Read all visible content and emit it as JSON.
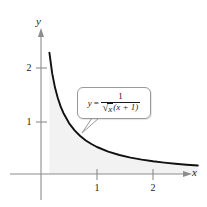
{
  "figure": {
    "name": "area-under-curve-figure",
    "background_color": "#ffffff"
  },
  "axes": {
    "x_label": "x",
    "y_label": "y",
    "x_ticks": [
      "1",
      "2"
    ],
    "y_ticks": [
      "1",
      "2"
    ],
    "axis_color": "#8c8c8c",
    "tick_color": "#8c8c8c"
  },
  "callout": {
    "name": "equation-callout",
    "lhs": "y",
    "equals": "=",
    "numerator": "1",
    "radical_sign": "√",
    "radicand": "x",
    "denominator_rest": "(x + 1)",
    "border_color": "#9a9a9a",
    "fill_color": "#ffffff"
  },
  "curve": {
    "name": "function-curve",
    "color": "#111111",
    "fill_color": "#f2f2f2"
  },
  "chart_data": {
    "type": "line",
    "title": "",
    "xlabel": "x",
    "ylabel": "y",
    "equation": "y = 1 / ( sqrt(x) * (x + 1) )",
    "xlim": [
      -0.28,
      2.95
    ],
    "ylim": [
      -0.22,
      2.72
    ],
    "xticks": [
      1,
      2
    ],
    "yticks": [
      1,
      2
    ],
    "grid": false,
    "legend": null,
    "shaded_region": {
      "label": "area under curve",
      "x_from": 0.0,
      "x_to": 2.8,
      "fill": "#f2f2f2"
    },
    "annotations": [
      {
        "text": "y = 1/(√x(x + 1))",
        "x": 1.05,
        "y": 1.28,
        "type": "callout",
        "pointer_x": 0.72,
        "pointer_y": 0.68
      }
    ],
    "x": [
      0.15,
      0.2,
      0.25,
      0.3,
      0.35,
      0.4,
      0.5,
      0.6,
      0.7,
      0.8,
      0.9,
      1.0,
      1.2,
      1.4,
      1.6,
      1.8,
      2.0,
      2.2,
      2.4,
      2.6,
      2.8
    ],
    "y": [
      2.246,
      1.863,
      1.6,
      1.407,
      1.252,
      1.13,
      0.943,
      0.807,
      0.703,
      0.621,
      0.555,
      0.5,
      0.415,
      0.352,
      0.304,
      0.266,
      0.236,
      0.211,
      0.19,
      0.172,
      0.157
    ]
  }
}
